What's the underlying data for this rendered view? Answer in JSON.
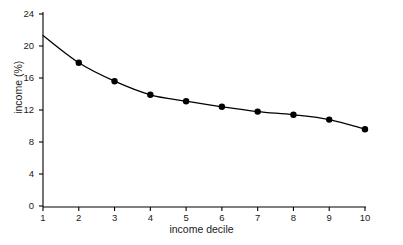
{
  "chart_data": {
    "type": "line",
    "title": "",
    "xlabel": "income decile",
    "ylabel": "income (%)",
    "x": [
      1,
      2,
      3,
      4,
      5,
      6,
      7,
      8,
      9,
      10
    ],
    "values": [
      21.3,
      17.9,
      15.6,
      13.9,
      13.1,
      12.4,
      11.8,
      11.4,
      10.8,
      9.6
    ],
    "categories": [
      "1",
      "2",
      "3",
      "4",
      "5",
      "6",
      "7",
      "8",
      "9",
      "10"
    ],
    "xlim": [
      1,
      10
    ],
    "ylim": [
      0,
      24
    ],
    "xticks": [
      "1",
      "2",
      "3",
      "4",
      "5",
      "6",
      "7",
      "8",
      "9",
      "10"
    ],
    "yticks": [
      "0",
      "4",
      "8",
      "12",
      "16",
      "20",
      "24"
    ],
    "ytick_values": [
      0,
      4,
      8,
      12,
      16,
      20,
      24
    ],
    "grid": false,
    "legend": false,
    "marker": "filled-circle",
    "line_color": "#000000",
    "marker_color": "#000000",
    "axis_color": "#000000",
    "background": "#ffffff"
  },
  "axes": {
    "x_title": "income decile",
    "y_title": "income (%)"
  }
}
